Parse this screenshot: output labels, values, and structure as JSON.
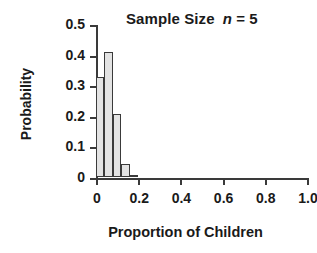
{
  "chart_data": {
    "type": "bar",
    "title_parts": {
      "main": "Sample Size",
      "symbol": "n",
      "equals": "= 5"
    },
    "xlabel": "Proportion of Children",
    "ylabel": "Probability",
    "categories": [
      "0.00",
      "0.04",
      "0.08",
      "0.12",
      "0.16"
    ],
    "x": [
      0.02,
      0.06,
      0.1,
      0.14,
      0.18
    ],
    "values": [
      0.328,
      0.41,
      0.205,
      0.041,
      0.004
    ],
    "bar_width": 0.04,
    "xlim": [
      0,
      1.0
    ],
    "ylim": [
      0,
      0.5
    ],
    "xticks": [
      0,
      0.2,
      0.4,
      0.6,
      0.8,
      1.0
    ],
    "xtick_labels": [
      "0",
      "0.2",
      "0.4",
      "0.6",
      "0.8",
      "1.0"
    ],
    "yticks": [
      0,
      0.1,
      0.2,
      0.3,
      0.4,
      0.5
    ],
    "ytick_labels": [
      "0",
      "0.1",
      "0.2",
      "0.3",
      "0.4",
      "0.5"
    ],
    "grid": false,
    "legend": null,
    "colors": {
      "bar_fill": "#e3e3e3",
      "bar_edge": "#3a3a3a",
      "axis": "#3a3a3a",
      "text": "#1a1a1a",
      "background": "#ffffff"
    }
  }
}
